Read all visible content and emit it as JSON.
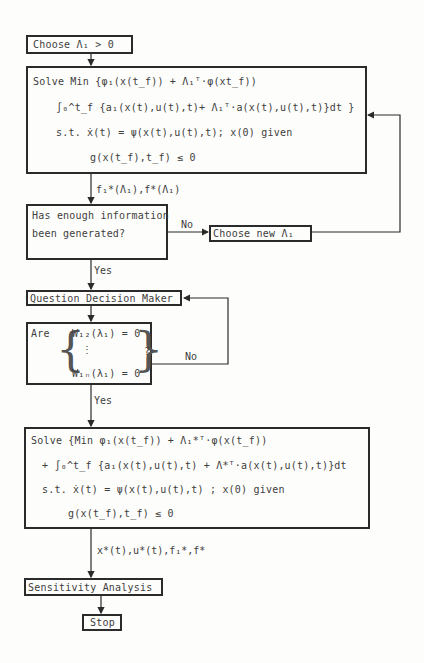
{
  "diagram": {
    "type": "flowchart",
    "nodes": {
      "choose": {
        "label": "Choose Λ₁ > 0"
      },
      "solve1": {
        "lines": [
          "Solve Min  {φ₁(x(t_f)) + Λ₁ᵀ·φ(xt_f))",
          "∫₀^t_f {a₁(x(t),u(t),t)+ Λ₁ᵀ·a(x(t),u(t),t)}dt }",
          "s.t. ẋ(t) = ψ(x(t),u(t),t); x(0) given",
          "g(x(t_f),t_f) ≤ 0"
        ]
      },
      "decision1": {
        "lines": [
          "Has enough information",
          "been generated?"
        ]
      },
      "choose_new": {
        "label": "Choose new Λ₁"
      },
      "question": {
        "label": "Question Decision Maker"
      },
      "decision2": {
        "prefix": "Are",
        "lines": [
          "W₁₂(λ₁) = 0",
          "⋮",
          "W₁ₙ(λ₁) = 0"
        ],
        "suffix": "?"
      },
      "solve2": {
        "lines": [
          "Solve {Min φ₁(x(t_f)) + Λ₁*ᵀ·φ(x(t_f))",
          "+ ∫₀^t_f {a₁(x(t),u(t),t) + Λ*ᵀ·a(x(t),u(t),t)}dt",
          "s.t. ẋ(t) = ψ(x(t),u(t),t) ; x(0) given",
          "g(x(t_f),t_f) ≤ 0"
        ]
      },
      "sensitivity": {
        "label": "Sensitivity Analysis"
      },
      "stop": {
        "label": "Stop"
      }
    },
    "edges": {
      "solve1_out": "f₁*(Λ₁),f*(Λ₁)",
      "d1_no": "No",
      "d1_yes": "Yes",
      "d2_no": "No",
      "d2_yes": "Yes",
      "solve2_out": "x*(t),u*(t),f₁*,f*"
    }
  }
}
